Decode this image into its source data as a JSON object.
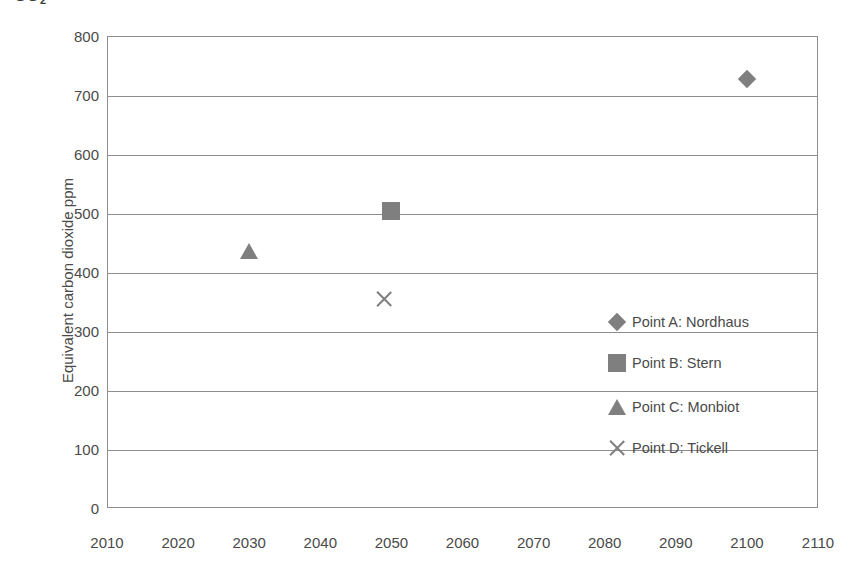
{
  "title": {
    "text_visible_fragment": "CO",
    "subscript": "2",
    "note": "title row is clipped by the top edge of the screenshot"
  },
  "chart_data": {
    "type": "scatter",
    "title": "",
    "xlabel": "",
    "ylabel": "Equivalent carbon dioxide ppm",
    "xlim": [
      2010,
      2110
    ],
    "ylim": [
      0,
      800
    ],
    "grid": true,
    "grid_axis": "y",
    "legend_position": "inside-right",
    "x_ticks": [
      2010,
      2020,
      2030,
      2040,
      2050,
      2060,
      2070,
      2080,
      2090,
      2100,
      2110
    ],
    "y_ticks": [
      0,
      100,
      200,
      300,
      400,
      500,
      600,
      700,
      800
    ],
    "marker_color": "#7f7f7f",
    "axis_color": "#8d8d8d",
    "text_color": "#4a4a4a",
    "series": [
      {
        "name": "Point A: Nordhaus",
        "marker": "diamond",
        "x": 2100,
        "y": 727
      },
      {
        "name": "Point B: Stern",
        "marker": "square",
        "x": 2050,
        "y": 503
      },
      {
        "name": "Point C: Monbiot",
        "marker": "triangle",
        "x": 2030,
        "y": 436
      },
      {
        "name": "Point D: Tickell",
        "marker": "cross",
        "x": 2049,
        "y": 354
      }
    ]
  }
}
